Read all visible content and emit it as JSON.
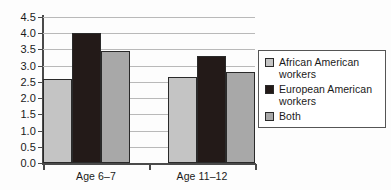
{
  "chart_data": {
    "type": "bar",
    "title": "",
    "subtitle": "",
    "xlabel": "",
    "ylabel": "",
    "categories": [
      "Age 6–7",
      "Age 11–12"
    ],
    "series": [
      {
        "name": "African American workers",
        "color": "#c4c4c4",
        "values": [
          2.6,
          2.65
        ]
      },
      {
        "name": "European American workers",
        "color": "#231a18",
        "values": [
          4.0,
          3.3
        ]
      },
      {
        "name": "Both",
        "color": "#a8a8a8",
        "values": [
          3.45,
          2.8
        ]
      }
    ],
    "ylim": [
      0.0,
      4.5
    ],
    "ytick_values": [
      0.0,
      0.5,
      1.0,
      1.5,
      2.0,
      2.5,
      3.0,
      3.5,
      4.0,
      4.5
    ],
    "ytick_labels": [
      "0.0",
      "0.5",
      "1.0",
      "1.5",
      "2.0",
      "2.5",
      "3.0",
      "3.5",
      "4.0",
      "4.5"
    ],
    "grid": true,
    "grid_axis": "y",
    "legend_position": "right",
    "legend_entries": [
      "African American workers",
      "European American workers",
      "Both"
    ]
  }
}
